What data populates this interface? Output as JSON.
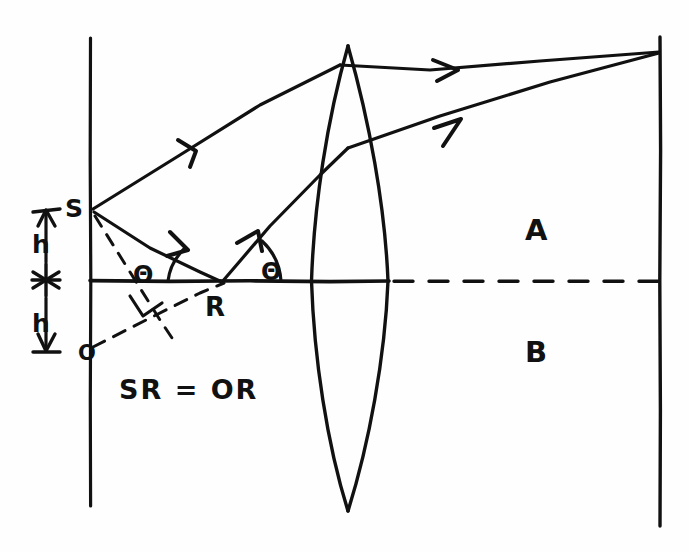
{
  "figure": {
    "kind": "hand-drawn-optics-ray-diagram",
    "background_color": "#fefefe",
    "ink_color": "#111111",
    "width": 689,
    "height": 552
  },
  "labels": {
    "source_point": "S",
    "object_point": "O",
    "reflection_point": "R",
    "angle_incidence": "Θ",
    "angle_reflection": "Θ",
    "height_upper": "h",
    "height_lower": "h",
    "region_above_axis": "A",
    "region_below_axis": "B",
    "relation_note": "SR = OR"
  },
  "geometry": {
    "left_plane_x": 90,
    "right_plane_x": 660,
    "axis_y": 281,
    "lens_center_x": 348,
    "lens_top_y": 45,
    "lens_bottom_y": 512,
    "lens_left_edge_x": 311,
    "lens_right_edge_x": 388,
    "source_point": [
      92,
      210
    ],
    "object_point": [
      92,
      348
    ],
    "reflection_point": [
      222,
      282
    ],
    "image_point": [
      660,
      52
    ],
    "axis_solid_end_x": 388,
    "dimension_line_x": 45
  },
  "elements": {
    "rays": [
      {
        "name": "ray-upper-from-source",
        "style": "solid",
        "has_arrowhead": true
      },
      {
        "name": "ray-source-to-reflection",
        "style": "solid",
        "has_arrowhead": true
      },
      {
        "name": "ray-reflected-from-R",
        "style": "solid",
        "has_arrowhead": true
      },
      {
        "name": "ray-upper-exit-to-image",
        "style": "solid",
        "has_arrowhead": true
      },
      {
        "name": "ray-lower-exit-to-image",
        "style": "solid",
        "has_arrowhead": true
      }
    ],
    "construction_lines": [
      {
        "name": "dashed-source-perpendicular",
        "style": "dashed"
      },
      {
        "name": "dashed-object-to-reflection",
        "style": "dashed"
      },
      {
        "name": "dashed-optical-axis-right",
        "style": "dashed"
      }
    ],
    "marks": [
      {
        "name": "right-angle-mark",
        "style": "square-corner"
      },
      {
        "name": "asterisk-mark-on-axis",
        "style": "star"
      },
      {
        "name": "angle-arc-incidence",
        "style": "arc"
      },
      {
        "name": "angle-arc-reflection",
        "style": "arc"
      }
    ]
  }
}
